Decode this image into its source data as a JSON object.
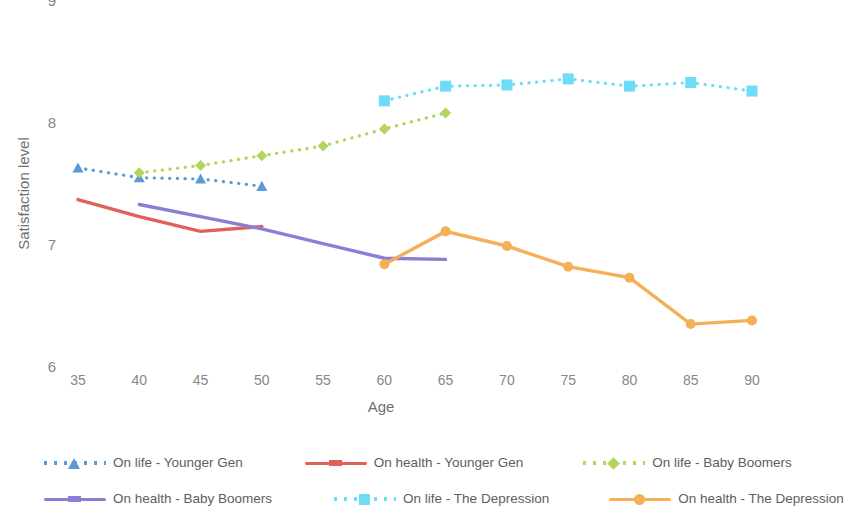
{
  "chart_data": {
    "type": "line",
    "title": "",
    "xlabel": "Age",
    "ylabel": "Satisfaction level",
    "xlim": [
      32.5,
      92.5
    ],
    "ylim": [
      6,
      9
    ],
    "xticks": [
      35,
      40,
      45,
      50,
      55,
      60,
      65,
      70,
      75,
      80,
      85,
      90
    ],
    "yticks": [
      6,
      7,
      8,
      9
    ],
    "grid": false,
    "legend_position": "bottom",
    "series": [
      {
        "name": "On life - Younger Gen",
        "color": "#5b9bd5",
        "linestyle": "dotted",
        "marker": "triangle",
        "x": [
          35,
          40,
          45,
          50
        ],
        "values": [
          7.64,
          7.56,
          7.55,
          7.49
        ]
      },
      {
        "name": "On health - Younger Gen",
        "color": "#e0605a",
        "linestyle": "solid",
        "marker": "none",
        "x": [
          35,
          40,
          45,
          50
        ],
        "values": [
          7.38,
          7.24,
          7.12,
          7.16
        ]
      },
      {
        "name": "On life - Baby Boomers",
        "color": "#b3d45e",
        "linestyle": "dotted",
        "marker": "diamond",
        "x": [
          40,
          45,
          50,
          55,
          60,
          65
        ],
        "values": [
          7.6,
          7.66,
          7.74,
          7.82,
          7.96,
          8.09
        ]
      },
      {
        "name": "On health - Baby Boomers",
        "color": "#8b7fd4",
        "linestyle": "solid",
        "marker": "none",
        "x": [
          40,
          45,
          50,
          55,
          60,
          65
        ],
        "values": [
          7.34,
          7.24,
          7.14,
          7.02,
          6.9,
          6.89
        ]
      },
      {
        "name": "On life - The Depression",
        "color": "#6fdcf5",
        "linestyle": "dotted",
        "marker": "square",
        "x": [
          60,
          65,
          70,
          75,
          80,
          85,
          90
        ],
        "values": [
          8.19,
          8.31,
          8.32,
          8.37,
          8.31,
          8.34,
          8.27
        ]
      },
      {
        "name": "On health - The Depression",
        "color": "#f5b057",
        "linestyle": "solid",
        "marker": "circle",
        "x": [
          60,
          65,
          70,
          75,
          80,
          85,
          90
        ],
        "values": [
          6.85,
          7.12,
          7.0,
          6.83,
          6.74,
          6.36,
          6.39
        ]
      }
    ]
  },
  "axes": {
    "y_title": "Satisfaction level",
    "x_title": "Age",
    "y_tick_labels": [
      "9",
      "8",
      "7",
      "6"
    ],
    "x_tick_labels": [
      "35",
      "40",
      "45",
      "50",
      "55",
      "60",
      "65",
      "70",
      "75",
      "80",
      "85",
      "90"
    ]
  },
  "legend": {
    "items": [
      {
        "label": "On life - Younger Gen",
        "color": "#5b9bd5",
        "style": "dotted",
        "marker": "triangle"
      },
      {
        "label": "On health - Younger Gen",
        "color": "#e0605a",
        "style": "solid",
        "marker": "dash"
      },
      {
        "label": "On life - Baby Boomers",
        "color": "#b3d45e",
        "style": "dotted",
        "marker": "diamond"
      },
      {
        "label": "On health - Baby Boomers",
        "color": "#8b7fd4",
        "style": "solid",
        "marker": "dash"
      },
      {
        "label": "On life - The Depression",
        "color": "#6fdcf5",
        "style": "dotted",
        "marker": "square"
      },
      {
        "label": "On health - The Depression",
        "color": "#f5b057",
        "style": "solid",
        "marker": "circle"
      }
    ]
  }
}
